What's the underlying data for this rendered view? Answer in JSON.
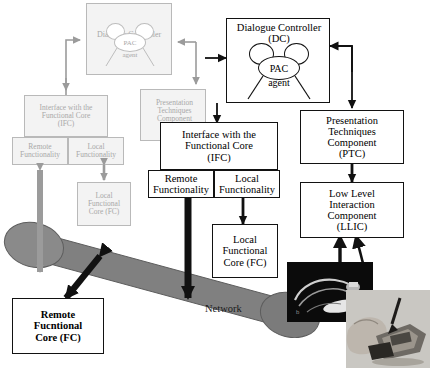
{
  "figure": {
    "network_label": "Network",
    "colors": {
      "foreground_stroke": "#121212",
      "background_stroke": "#b9b9b9",
      "background_fill": "#f3f3f3",
      "background_text": "#a8a8a8",
      "network_tube": "#808080",
      "arrow_dark": "#111111",
      "arrow_gray": "#9b9b9b"
    }
  },
  "background_layer": {
    "description": "faded grey duplicate of the architecture shown behind the crisp foreground layer",
    "dialogue_controller": {
      "line1": "Dialogue Controller",
      "line2": "(DC)",
      "agent_label": "PAC",
      "agent_sub": "agent"
    },
    "ifc": {
      "line1": "Interface with the",
      "line2": "Functional Core",
      "line3": "(IFC)"
    },
    "remote_functionality": {
      "line1": "Remote",
      "line2": "Functionality"
    },
    "local_functionality": {
      "line1": "Local",
      "line2": "Functionality"
    },
    "local_functional_core": {
      "line1": "Local",
      "line2": "Functional",
      "line3": "Core (FC)"
    },
    "ptc": {
      "line1": "Presentation",
      "line2": "Techniques",
      "line3": "Component",
      "line4": "(PTC)"
    }
  },
  "foreground_layer": {
    "dialogue_controller": {
      "line1": "Dialogue Controller",
      "line2": "(DC)",
      "agent_label": "PAC",
      "agent_sub": "agent"
    },
    "ifc": {
      "line1": "Interface with the",
      "line2": "Functional Core",
      "line3": "(IFC)"
    },
    "remote_functionality": {
      "line1": "Remote",
      "line2": "Functionality"
    },
    "local_functionality": {
      "line1": "Local",
      "line2": "Functionality"
    },
    "local_functional_core": {
      "line1": "Local",
      "line2": "Functional",
      "line3": "Core (FC)"
    },
    "ptc": {
      "line1": "Presentation",
      "line2": "Techniques",
      "line3": "Component",
      "line4": "(PTC)"
    },
    "llic": {
      "line1": "Low Level",
      "line2": "Interaction",
      "line3": "Component",
      "line4": "(LLIC)"
    },
    "remote_functional_core": {
      "line1": "Remote",
      "line2": "Fucntional",
      "line3": "Core (FC)"
    }
  },
  "photos": [
    {
      "name": "dark-device-photo",
      "caption": ""
    },
    {
      "name": "hand-holding-pda-photo",
      "caption": ""
    }
  ]
}
